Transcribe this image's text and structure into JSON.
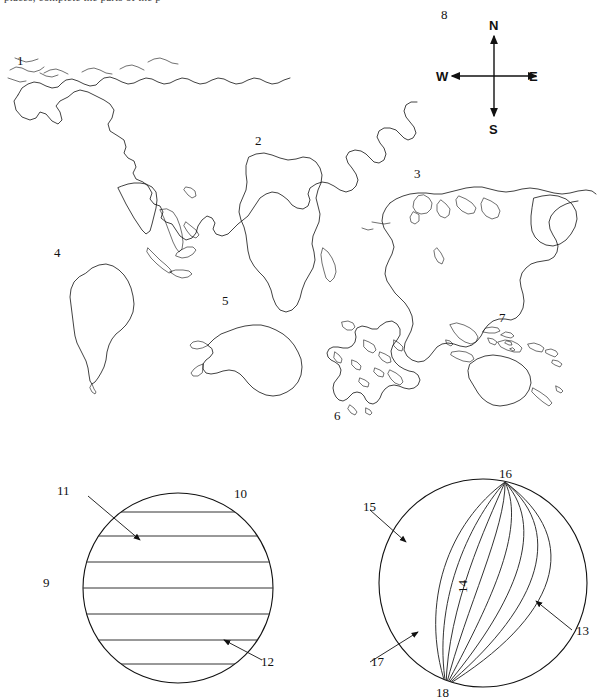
{
  "worksheet": {
    "clipped_instruction": "places, complete the parts of the p",
    "title_visible": false
  },
  "compass": {
    "name": "compass-rose",
    "label_number": "8",
    "north": "N",
    "south": "S",
    "east": "E",
    "west": "W"
  },
  "world_map": {
    "name": "world-map-outline",
    "labels": [
      {
        "number": "1",
        "x": 17,
        "y": 60,
        "refers_to": "asia"
      },
      {
        "number": "2",
        "x": 255,
        "y": 137,
        "refers_to": "africa"
      },
      {
        "number": "3",
        "x": 415,
        "y": 170,
        "refers_to": "north-america"
      },
      {
        "number": "4",
        "x": 55,
        "y": 249,
        "refers_to": "south-america"
      },
      {
        "number": "5",
        "x": 223,
        "y": 297,
        "refers_to": "antarctica"
      },
      {
        "number": "6",
        "x": 336,
        "y": 410,
        "refers_to": "europe"
      },
      {
        "number": "7",
        "x": 500,
        "y": 314,
        "refers_to": "australia-oceania"
      }
    ]
  },
  "globe_latitude": {
    "name": "latitude-globe",
    "caption": "globe with horizontal latitude lines",
    "labels": [
      {
        "number": "9",
        "x": 43,
        "y": 576,
        "role": "plain"
      },
      {
        "number": "10",
        "x": 235,
        "y": 487,
        "role": "plain"
      },
      {
        "number": "11",
        "x": 58,
        "y": 484,
        "role": "leader-arrow"
      },
      {
        "number": "12",
        "x": 261,
        "y": 655,
        "role": "leader-arrow"
      }
    ],
    "line_count": 8
  },
  "globe_longitude": {
    "name": "longitude-globe",
    "caption": "globe with vertical meridian lines",
    "labels": [
      {
        "number": "13",
        "x": 576,
        "y": 624,
        "role": "leader-arrow"
      },
      {
        "number": "14",
        "x": 462,
        "y": 586,
        "role": "rotated"
      },
      {
        "number": "15",
        "x": 364,
        "y": 500,
        "role": "leader-arrow"
      },
      {
        "number": "16",
        "x": 500,
        "y": 469,
        "role": "plain"
      },
      {
        "number": "17",
        "x": 372,
        "y": 655,
        "role": "leader-arrow"
      },
      {
        "number": "18",
        "x": 437,
        "y": 686,
        "role": "plain"
      }
    ],
    "meridian_count": 8
  },
  "colors": {
    "ink": "#111111",
    "page": "#ffffff",
    "grid": "#333333"
  }
}
